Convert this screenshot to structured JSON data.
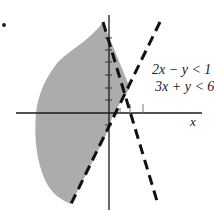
{
  "figure": {
    "marker": "•",
    "axes": {
      "x_label": "x",
      "y_label": "",
      "origin_px": [
        109,
        113
      ],
      "x_ticks_px": [
        130,
        143
      ],
      "y_ticks_px": [
        38,
        50,
        62,
        75,
        88,
        100,
        125
      ]
    },
    "inequalities": [
      {
        "text": "2x − y < 1",
        "boundary": "y = 2x − 1",
        "style": "dashed"
      },
      {
        "text": "3x + y < 6",
        "boundary": "y = −3x + 6",
        "style": "dashed"
      }
    ],
    "shaded_region": "solution set of both inequalities (left of both lines)",
    "colors": {
      "shade": "#a8a8a8",
      "line": "#1a1a1a",
      "background": "#ffffff"
    }
  }
}
